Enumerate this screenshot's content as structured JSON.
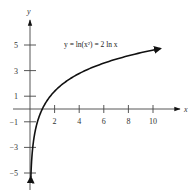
{
  "chart_data": {
    "type": "line",
    "title": "",
    "xlabel": "x",
    "ylabel": "y",
    "xlim": [
      -1,
      11.5
    ],
    "ylim": [
      -6,
      6.5
    ],
    "grid": false,
    "legend": null,
    "x_ticks": [
      2,
      4,
      6,
      8,
      10
    ],
    "x_tick_labels": [
      "2",
      "4",
      "6",
      "8",
      "10"
    ],
    "y_ticks": [
      5,
      3,
      1,
      -1,
      -3,
      -5
    ],
    "y_tick_labels": [
      "5",
      "3",
      "1",
      "−1",
      "−3",
      "−5"
    ],
    "annotations": [
      {
        "text": "y = ln(x²) = 2 ln x",
        "x": 2.7,
        "y": 4.9
      }
    ],
    "series": [
      {
        "name": "y = ln(x²) = 2 ln x",
        "function": "2*ln(x)",
        "x": [
          0.07,
          0.1,
          0.15,
          0.2,
          0.3,
          0.4,
          0.5,
          0.6,
          0.8,
          1,
          1.5,
          2,
          3,
          4,
          5,
          6,
          7,
          8,
          9,
          10,
          10.6
        ],
        "values": [
          -5.32,
          -4.61,
          -3.79,
          -3.22,
          -2.41,
          -1.83,
          -1.39,
          -1.02,
          -0.45,
          0,
          0.81,
          1.39,
          2.2,
          2.77,
          3.22,
          3.58,
          3.89,
          4.16,
          4.39,
          4.61,
          4.72
        ],
        "arrow_both_ends": true,
        "color": "#111111"
      }
    ]
  },
  "labels": {
    "x_axis": "x",
    "y_axis": "y",
    "equation": "y = ln(x²) = 2 ln x"
  }
}
